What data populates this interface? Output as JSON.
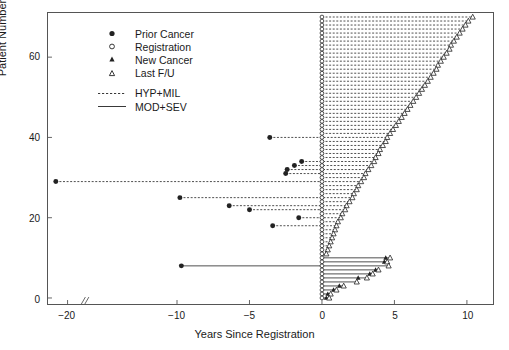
{
  "chart_data": {
    "type": "scatter",
    "title": "",
    "xlabel": "Years Since Registration",
    "ylabel": "Patient Number",
    "xlim": [
      -24.5,
      11.8
    ],
    "ylim": [
      -1.5,
      71
    ],
    "grid": false,
    "axis_break": {
      "present": true,
      "symbol": "//",
      "x": -16.5
    },
    "xticks": [
      -20,
      -10,
      -5,
      0,
      5,
      10
    ],
    "xtick_labels": [
      "-20",
      "-10",
      "-5",
      "0",
      "5",
      "10"
    ],
    "yticks": [
      0,
      20,
      40,
      60
    ],
    "ytick_labels": [
      "0",
      "20",
      "40",
      "60"
    ],
    "legend": {
      "position": "top-left",
      "entries": [
        {
          "label": "Prior Cancer",
          "symbol": "filled-circle"
        },
        {
          "label": "Registration",
          "symbol": "open-circle"
        },
        {
          "label": "New Cancer",
          "symbol": "filled-triangle"
        },
        {
          "label": "Last F/U",
          "symbol": "open-triangle"
        },
        {
          "label": "HYP+MIL",
          "symbol": "dashed-line"
        },
        {
          "label": "MOD+SEV",
          "symbol": "solid-line"
        }
      ]
    },
    "series": [
      {
        "name": "HYP+MIL",
        "linestyle": "dashed",
        "color": "#222222"
      },
      {
        "name": "MOD+SEV",
        "linestyle": "solid",
        "color": "#222222"
      }
    ],
    "patients": [
      {
        "id": 70,
        "group": "HYP+MIL",
        "registration": 0,
        "last_fu": 10.4,
        "prior_cancer": null,
        "new_cancers": []
      },
      {
        "id": 69,
        "group": "HYP+MIL",
        "registration": 0,
        "last_fu": 10.1,
        "prior_cancer": null,
        "new_cancers": []
      },
      {
        "id": 68,
        "group": "HYP+MIL",
        "registration": 0,
        "last_fu": 9.9,
        "prior_cancer": null,
        "new_cancers": []
      },
      {
        "id": 67,
        "group": "HYP+MIL",
        "registration": 0,
        "last_fu": 9.7,
        "prior_cancer": null,
        "new_cancers": []
      },
      {
        "id": 66,
        "group": "HYP+MIL",
        "registration": 0,
        "last_fu": 9.5,
        "prior_cancer": null,
        "new_cancers": []
      },
      {
        "id": 65,
        "group": "HYP+MIL",
        "registration": 0,
        "last_fu": 9.3,
        "prior_cancer": null,
        "new_cancers": []
      },
      {
        "id": 64,
        "group": "HYP+MIL",
        "registration": 0,
        "last_fu": 9.1,
        "prior_cancer": null,
        "new_cancers": []
      },
      {
        "id": 63,
        "group": "HYP+MIL",
        "registration": 0,
        "last_fu": 8.9,
        "prior_cancer": null,
        "new_cancers": []
      },
      {
        "id": 62,
        "group": "HYP+MIL",
        "registration": 0,
        "last_fu": 8.8,
        "prior_cancer": null,
        "new_cancers": []
      },
      {
        "id": 61,
        "group": "HYP+MIL",
        "registration": 0,
        "last_fu": 8.6,
        "prior_cancer": null,
        "new_cancers": []
      },
      {
        "id": 60,
        "group": "HYP+MIL",
        "registration": 0,
        "last_fu": 8.4,
        "prior_cancer": null,
        "new_cancers": []
      },
      {
        "id": 59,
        "group": "HYP+MIL",
        "registration": 0,
        "last_fu": 8.2,
        "prior_cancer": null,
        "new_cancers": []
      },
      {
        "id": 58,
        "group": "HYP+MIL",
        "registration": 0,
        "last_fu": 8.0,
        "prior_cancer": null,
        "new_cancers": []
      },
      {
        "id": 57,
        "group": "HYP+MIL",
        "registration": 0,
        "last_fu": 7.9,
        "prior_cancer": null,
        "new_cancers": []
      },
      {
        "id": 56,
        "group": "HYP+MIL",
        "registration": 0,
        "last_fu": 7.7,
        "prior_cancer": null,
        "new_cancers": []
      },
      {
        "id": 55,
        "group": "HYP+MIL",
        "registration": 0,
        "last_fu": 7.5,
        "prior_cancer": null,
        "new_cancers": []
      },
      {
        "id": 54,
        "group": "HYP+MIL",
        "registration": 0,
        "last_fu": 7.3,
        "prior_cancer": null,
        "new_cancers": []
      },
      {
        "id": 53,
        "group": "HYP+MIL",
        "registration": 0,
        "last_fu": 7.1,
        "prior_cancer": null,
        "new_cancers": []
      },
      {
        "id": 52,
        "group": "HYP+MIL",
        "registration": 0,
        "last_fu": 6.9,
        "prior_cancer": null,
        "new_cancers": []
      },
      {
        "id": 51,
        "group": "HYP+MIL",
        "registration": 0,
        "last_fu": 6.7,
        "prior_cancer": null,
        "new_cancers": []
      },
      {
        "id": 50,
        "group": "HYP+MIL",
        "registration": 0,
        "last_fu": 6.5,
        "prior_cancer": null,
        "new_cancers": []
      },
      {
        "id": 49,
        "group": "HYP+MIL",
        "registration": 0,
        "last_fu": 6.3,
        "prior_cancer": null,
        "new_cancers": []
      },
      {
        "id": 48,
        "group": "HYP+MIL",
        "registration": 0,
        "last_fu": 6.1,
        "prior_cancer": null,
        "new_cancers": []
      },
      {
        "id": 47,
        "group": "HYP+MIL",
        "registration": 0,
        "last_fu": 5.9,
        "prior_cancer": null,
        "new_cancers": []
      },
      {
        "id": 46,
        "group": "HYP+MIL",
        "registration": 0,
        "last_fu": 5.7,
        "prior_cancer": null,
        "new_cancers": []
      },
      {
        "id": 45,
        "group": "HYP+MIL",
        "registration": 0,
        "last_fu": 5.5,
        "prior_cancer": null,
        "new_cancers": []
      },
      {
        "id": 44,
        "group": "HYP+MIL",
        "registration": 0,
        "last_fu": 5.3,
        "prior_cancer": null,
        "new_cancers": []
      },
      {
        "id": 43,
        "group": "HYP+MIL",
        "registration": 0,
        "last_fu": 5.1,
        "prior_cancer": null,
        "new_cancers": []
      },
      {
        "id": 42,
        "group": "HYP+MIL",
        "registration": 0,
        "last_fu": 4.9,
        "prior_cancer": null,
        "new_cancers": []
      },
      {
        "id": 41,
        "group": "HYP+MIL",
        "registration": 0,
        "last_fu": 4.7,
        "prior_cancer": null,
        "new_cancers": []
      },
      {
        "id": 40,
        "group": "HYP+MIL",
        "registration": 0,
        "last_fu": 4.5,
        "prior_cancer": -3.6,
        "new_cancers": []
      },
      {
        "id": 39,
        "group": "HYP+MIL",
        "registration": 0,
        "last_fu": 4.4,
        "prior_cancer": null,
        "new_cancers": []
      },
      {
        "id": 38,
        "group": "HYP+MIL",
        "registration": 0,
        "last_fu": 4.2,
        "prior_cancer": null,
        "new_cancers": []
      },
      {
        "id": 37,
        "group": "HYP+MIL",
        "registration": 0,
        "last_fu": 4.0,
        "prior_cancer": null,
        "new_cancers": []
      },
      {
        "id": 36,
        "group": "HYP+MIL",
        "registration": 0,
        "last_fu": 3.9,
        "prior_cancer": null,
        "new_cancers": []
      },
      {
        "id": 35,
        "group": "HYP+MIL",
        "registration": 0,
        "last_fu": 3.7,
        "prior_cancer": null,
        "new_cancers": []
      },
      {
        "id": 34,
        "group": "HYP+MIL",
        "registration": 0,
        "last_fu": 3.6,
        "prior_cancer": -1.4,
        "new_cancers": []
      },
      {
        "id": 33,
        "group": "HYP+MIL",
        "registration": 0,
        "last_fu": 3.4,
        "prior_cancer": -1.9,
        "new_cancers": []
      },
      {
        "id": 32,
        "group": "HYP+MIL",
        "registration": 0,
        "last_fu": 3.2,
        "prior_cancer": -2.4,
        "new_cancers": []
      },
      {
        "id": 31,
        "group": "HYP+MIL",
        "registration": 0,
        "last_fu": 3.0,
        "prior_cancer": -2.5,
        "new_cancers": []
      },
      {
        "id": 30,
        "group": "HYP+MIL",
        "registration": 0,
        "last_fu": 2.9,
        "prior_cancer": null,
        "new_cancers": []
      },
      {
        "id": 29,
        "group": "HYP+MIL",
        "registration": 0,
        "last_fu": 2.7,
        "prior_cancer": -22.7,
        "new_cancers": []
      },
      {
        "id": 28,
        "group": "HYP+MIL",
        "registration": 0,
        "last_fu": 2.5,
        "prior_cancer": null,
        "new_cancers": []
      },
      {
        "id": 27,
        "group": "HYP+MIL",
        "registration": 0,
        "last_fu": 2.4,
        "prior_cancer": null,
        "new_cancers": []
      },
      {
        "id": 26,
        "group": "HYP+MIL",
        "registration": 0,
        "last_fu": 2.2,
        "prior_cancer": null,
        "new_cancers": []
      },
      {
        "id": 25,
        "group": "HYP+MIL",
        "registration": 0,
        "last_fu": 2.1,
        "prior_cancer": -9.8,
        "new_cancers": []
      },
      {
        "id": 24,
        "group": "HYP+MIL",
        "registration": 0,
        "last_fu": 1.9,
        "prior_cancer": null,
        "new_cancers": []
      },
      {
        "id": 23,
        "group": "HYP+MIL",
        "registration": 0,
        "last_fu": 1.7,
        "prior_cancer": -6.4,
        "new_cancers": []
      },
      {
        "id": 22,
        "group": "HYP+MIL",
        "registration": 0,
        "last_fu": 1.6,
        "prior_cancer": -5.0,
        "new_cancers": []
      },
      {
        "id": 21,
        "group": "HYP+MIL",
        "registration": 0,
        "last_fu": 1.4,
        "prior_cancer": null,
        "new_cancers": []
      },
      {
        "id": 20,
        "group": "HYP+MIL",
        "registration": 0,
        "last_fu": 1.3,
        "prior_cancer": -1.6,
        "new_cancers": []
      },
      {
        "id": 19,
        "group": "HYP+MIL",
        "registration": 0,
        "last_fu": 1.1,
        "prior_cancer": null,
        "new_cancers": []
      },
      {
        "id": 18,
        "group": "HYP+MIL",
        "registration": 0,
        "last_fu": 1.0,
        "prior_cancer": -3.4,
        "new_cancers": []
      },
      {
        "id": 17,
        "group": "HYP+MIL",
        "registration": 0,
        "last_fu": 0.9,
        "prior_cancer": null,
        "new_cancers": []
      },
      {
        "id": 16,
        "group": "HYP+MIL",
        "registration": 0,
        "last_fu": 0.8,
        "prior_cancer": null,
        "new_cancers": []
      },
      {
        "id": 15,
        "group": "HYP+MIL",
        "registration": 0,
        "last_fu": 0.7,
        "prior_cancer": null,
        "new_cancers": []
      },
      {
        "id": 14,
        "group": "HYP+MIL",
        "registration": 0,
        "last_fu": 0.6,
        "prior_cancer": null,
        "new_cancers": []
      },
      {
        "id": 13,
        "group": "HYP+MIL",
        "registration": 0,
        "last_fu": 0.5,
        "prior_cancer": null,
        "new_cancers": []
      },
      {
        "id": 12,
        "group": "HYP+MIL",
        "registration": 0,
        "last_fu": 0.4,
        "prior_cancer": null,
        "new_cancers": []
      },
      {
        "id": 11,
        "group": "HYP+MIL",
        "registration": 0,
        "last_fu": 0.3,
        "prior_cancer": null,
        "new_cancers": []
      },
      {
        "id": 10,
        "group": "MOD+SEV",
        "registration": 0,
        "last_fu": 4.7,
        "prior_cancer": null,
        "new_cancers": [
          4.4
        ]
      },
      {
        "id": 9,
        "group": "MOD+SEV",
        "registration": 0,
        "last_fu": 4.5,
        "prior_cancer": null,
        "new_cancers": [
          4.3
        ]
      },
      {
        "id": 8,
        "group": "MOD+SEV",
        "registration": 0,
        "last_fu": 4.6,
        "prior_cancer": -9.7,
        "new_cancers": []
      },
      {
        "id": 7,
        "group": "MOD+SEV",
        "registration": 0,
        "last_fu": 3.9,
        "prior_cancer": null,
        "new_cancers": [
          3.7
        ]
      },
      {
        "id": 6,
        "group": "MOD+SEV",
        "registration": 0,
        "last_fu": 3.5,
        "prior_cancer": null,
        "new_cancers": [
          3.3
        ]
      },
      {
        "id": 5,
        "group": "MOD+SEV",
        "registration": 0,
        "last_fu": 3.1,
        "prior_cancer": null,
        "new_cancers": [
          2.5
        ]
      },
      {
        "id": 4,
        "group": "MOD+SEV",
        "registration": 0,
        "last_fu": 2.4,
        "prior_cancer": null,
        "new_cancers": []
      },
      {
        "id": 3,
        "group": "MOD+SEV",
        "registration": 0,
        "last_fu": 1.5,
        "prior_cancer": null,
        "new_cancers": [
          1.2
        ]
      },
      {
        "id": 2,
        "group": "MOD+SEV",
        "registration": 0,
        "last_fu": 1.0,
        "prior_cancer": null,
        "new_cancers": [
          0.8
        ]
      },
      {
        "id": 1,
        "group": "MOD+SEV",
        "registration": 0,
        "last_fu": 0.6,
        "prior_cancer": null,
        "new_cancers": [
          0.4
        ]
      },
      {
        "id": 0,
        "group": "MOD+SEV",
        "registration": 0,
        "last_fu": 0.5,
        "prior_cancer": null,
        "new_cancers": [
          0.3
        ]
      }
    ]
  }
}
